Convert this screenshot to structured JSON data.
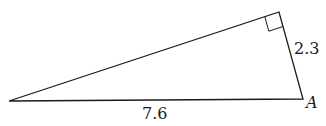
{
  "diagram": {
    "type": "right-triangle",
    "vertices": {
      "left": {
        "x": 9,
        "y": 101,
        "label": ""
      },
      "top": {
        "x": 279,
        "y": 12,
        "label": "",
        "right_angle": true
      },
      "bottom_right": {
        "x": 303,
        "y": 99,
        "label": "A"
      }
    },
    "sides": {
      "short_leg": "2.3",
      "hypotenuse": "7.6"
    },
    "colors": {
      "stroke": "#1a1a1a",
      "background": "#ffffff"
    }
  }
}
